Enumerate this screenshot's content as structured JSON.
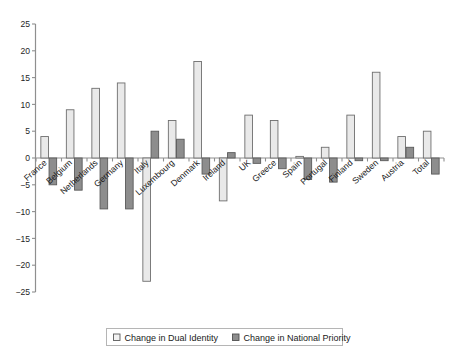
{
  "chart_data": {
    "type": "bar",
    "title": "",
    "subtitle": "",
    "xlabel": "",
    "ylabel": "",
    "ylim": [
      -25,
      25
    ],
    "ytick_step": 5,
    "grid": false,
    "legend_position": "bottom-center",
    "categories": [
      "France",
      "Belgium",
      "Netherlands",
      "Germany",
      "Italy",
      "Luxembourg",
      "Denmark",
      "Ireland",
      "UK",
      "Greece",
      "Spain",
      "Portugal",
      "Finland",
      "Sweden",
      "Austria",
      "Total"
    ],
    "yticks": [
      25,
      20,
      15,
      10,
      5,
      0,
      -5,
      -10,
      -15,
      -20,
      -25
    ],
    "ytick_labels": [
      "25",
      "20",
      "15",
      "10",
      "5",
      "0",
      "−5",
      "−10",
      "−15",
      "−20",
      "−25"
    ],
    "series": [
      {
        "name": "Change in Dual Identity",
        "color": "#e9e9e9",
        "edge_color": "#6e6e6e",
        "values": [
          4,
          9,
          13,
          14,
          -23,
          7,
          18,
          -8,
          8,
          7,
          0.3,
          2,
          8,
          16,
          4,
          5
        ]
      },
      {
        "name": "Change in National Priority",
        "color": "#8d8d8d",
        "edge_color": "#5a5a5a",
        "values": [
          -5,
          -6,
          -9.5,
          -9.5,
          5,
          3.5,
          -3,
          1,
          -1,
          -2,
          -4,
          -4.5,
          -0.5,
          -0.5,
          2,
          -3
        ]
      }
    ]
  },
  "legend": {
    "entries": [
      {
        "label": "Change in Dual Identity",
        "swatch": "light-square-swatch"
      },
      {
        "label": "Change in National Priority",
        "swatch": "dark-square-swatch"
      }
    ]
  }
}
